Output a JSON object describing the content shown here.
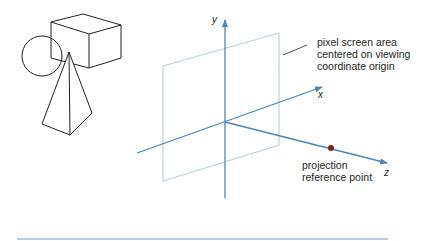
{
  "labels": {
    "screen_area": [
      "pixel screen area",
      "centered on viewing",
      "coordinate origin"
    ],
    "prp": [
      "projection",
      "reference point"
    ]
  },
  "axes": {
    "x": "x",
    "y": "y",
    "z": "z"
  },
  "colors": {
    "axis": "#4a86b8",
    "plane": "#b9d3de",
    "objects": "#231f20",
    "prp_point": "#8b1a1a",
    "rule": "#6a9cc8"
  }
}
